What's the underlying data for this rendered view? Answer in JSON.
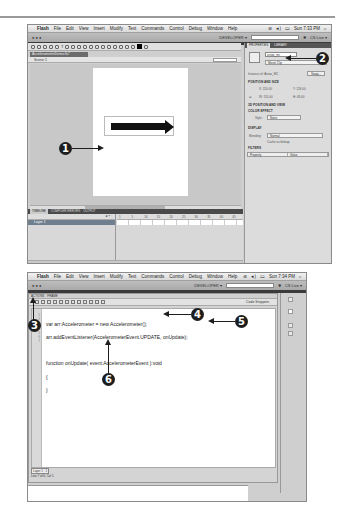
{
  "screenshot_top": {
    "menubar": {
      "app": "Flash",
      "items": [
        "File",
        "Edit",
        "View",
        "Insert",
        "Modify",
        "Text",
        "Commands",
        "Control",
        "Debug",
        "Window",
        "Help"
      ],
      "clock": "Sun 7:33 PM"
    },
    "appbar": {
      "workspace": "DEVELOPER ▾",
      "cs_live": "CS Live ▾"
    },
    "tools_label": "TOOLS",
    "document_tab": "AccelerometerDemo.fla*",
    "scene": "Scene 1",
    "zoom_value": "100%",
    "timeline": {
      "tabs": [
        "TIMELINE",
        "COMPILER ERRORS",
        "OUTPUT"
      ],
      "layer_name": "Layer 1",
      "frame_numbers": [
        "1",
        "5",
        "10",
        "15",
        "20",
        "25",
        "30",
        "35",
        "40",
        "45"
      ]
    },
    "properties": {
      "tabs": [
        "PROPERTIES",
        "LIBRARY"
      ],
      "instance_name": "arrow_mc",
      "symbol_type": "Movie Clip",
      "instance_of_label": "Instance of:",
      "instance_of_value": "Arrow_MC",
      "swap_button": "Swap...",
      "sections": [
        "POSITION AND SIZE",
        "3D POSITION AND VIEW",
        "COLOR EFFECT",
        "DISPLAY",
        "FILTERS"
      ],
      "position": {
        "x_label": "X:",
        "x": "220.00",
        "y_label": "Y:",
        "y": "226.00",
        "w_label": "W:",
        "w": "155.00",
        "h_label": "H:",
        "h": "48.00"
      },
      "style_label": "Style:",
      "style_value": "None",
      "blending_label": "Blending:",
      "blending_value": "Normal",
      "cache_label": "Cache as bitmap",
      "filter_columns": [
        "Property",
        "Value"
      ]
    }
  },
  "screenshot_bottom": {
    "menubar": {
      "app": "Flash",
      "items": [
        "File",
        "Edit",
        "View",
        "Insert",
        "Modify",
        "Text",
        "Commands",
        "Control",
        "Debug",
        "Window",
        "Help"
      ],
      "clock": "Sun 7:34 PM"
    },
    "appbar": {
      "workspace": "DEVELOPER ▾",
      "cs_live": "CS Live ▾"
    },
    "panel_tabs": [
      "ACTIONS",
      "FRAME"
    ],
    "code_snippets": "Code Snippets",
    "line_numbers": [
      "1",
      "2",
      "3",
      "4",
      "5",
      "6",
      "7"
    ],
    "code_lines": [
      "var arr:Accelerometer = new Accelerometer();",
      "arr.addEventListener(AccelerometerEvent.UPDATE, onUpdate);",
      "",
      "function onUpdate( event:AccelerometerEvent ):void",
      "{",
      "}",
      ""
    ],
    "status_tag": "Layer 1 : 1",
    "status_position": "Line 7 of 6, Col 1"
  },
  "callouts": [
    "1",
    "2",
    "3",
    "4",
    "5",
    "6"
  ]
}
